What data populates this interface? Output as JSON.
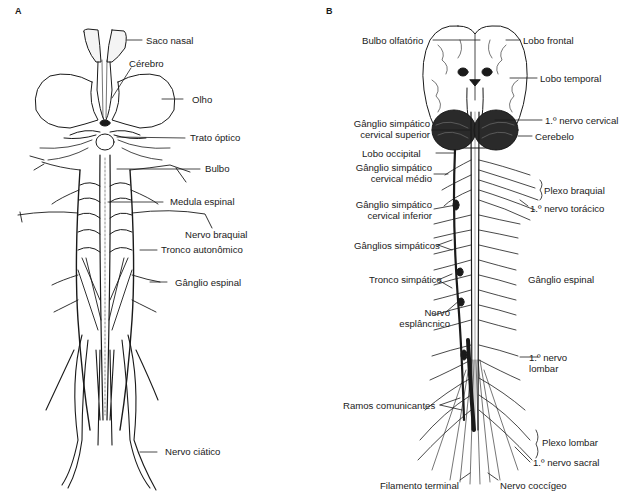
{
  "figure": {
    "panels": [
      {
        "id": "A",
        "letter": "A",
        "labels": {
          "saco_nasal": "Saco nasal",
          "cerebro": "Cérebro",
          "olho": "Olho",
          "trato_optico": "Trato óptico",
          "bulbo": "Bulbo",
          "medula_espinal": "Medula espinal",
          "nervo_braquial": "Nervo braquial",
          "tronco_autonomico": "Tronco autonômico",
          "ganglio_espinal": "Gânglio espinal",
          "nervo_ciatico": "Nervo ciático"
        }
      },
      {
        "id": "B",
        "letter": "B",
        "labels": {
          "bulbo_olfatorio": "Bulbo olfatório",
          "lobo_frontal": "Lobo frontal",
          "lobo_temporal": "Lobo temporal",
          "ganglio_cervical_superior_1": "Gânglio simpático",
          "ganglio_cervical_superior_2": "cervical superior",
          "primeiro_nervo_cervical": "1.º nervo cervical",
          "cerebelo": "Cerebelo",
          "lobo_occipital": "Lobo occipital",
          "ganglio_cervical_medio_1": "Gânglio simpático",
          "ganglio_cervical_medio_2": "cervical médio",
          "plexo_braquial": "Plexo braquial",
          "ganglio_cervical_inferior_1": "Gânglio simpático",
          "ganglio_cervical_inferior_2": "cervical inferior",
          "primeiro_nervo_toracico": "1.º nervo torácico",
          "ganglios_simpaticos": "Gânglios simpáticos",
          "tronco_simpatico": "Tronco simpático",
          "ganglio_espinal": "Gânglio espinal",
          "nervo_esplancnico_1": "Nervo",
          "nervo_esplancnico_2": "esplâncnico",
          "primeiro_nervo_lombar_1": "1.º nervo",
          "primeiro_nervo_lombar_2": "lombar",
          "ramos_comunicantes": "Ramos comunicantes",
          "plexo_lombar": "Plexo lombar",
          "primeiro_nervo_sacral": "1.º nervo sacral",
          "filamento_terminal": "Filamento terminal",
          "nervo_coccigeo": "Nervo coccígeo"
        }
      }
    ],
    "colors": {
      "ink": "#1a1a1a",
      "background": "#ffffff"
    }
  }
}
